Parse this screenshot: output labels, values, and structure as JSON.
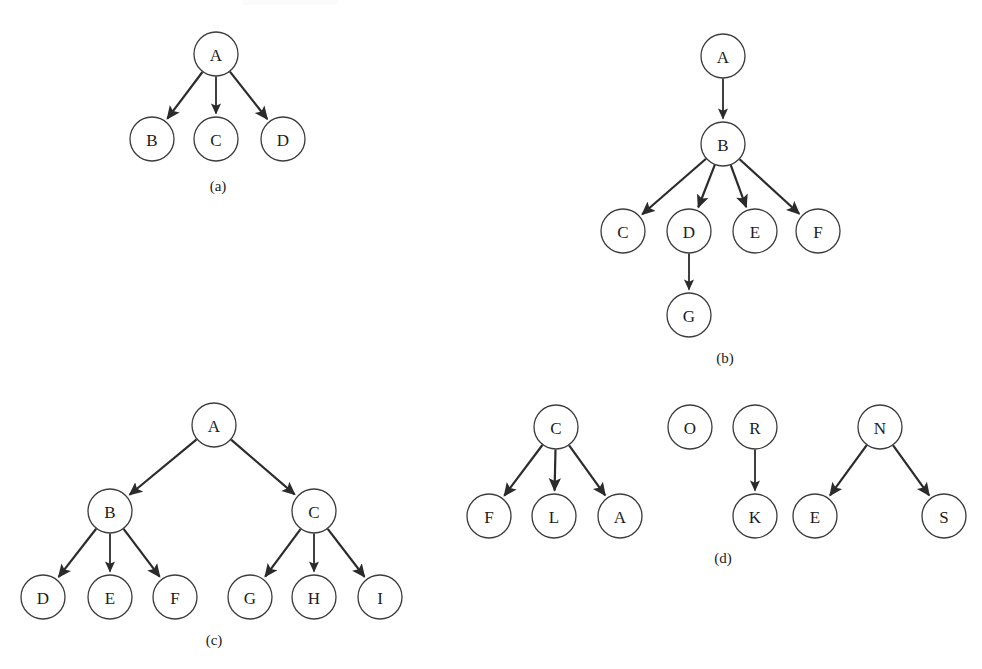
{
  "figure": {
    "width": 982,
    "height": 669,
    "background_color": "#ffffff",
    "node_stroke_color": "#3c3c3c",
    "edge_color": "#2b2b2b",
    "label_color": "#1c1c1c",
    "node_radius": 22,
    "caption_font_size": 15,
    "node_font_size": 17
  },
  "panels": [
    {
      "id": "a",
      "caption": "(a)",
      "caption_x": 218,
      "caption_y": 186,
      "nodes": [
        {
          "label": "A",
          "x": 216,
          "y": 54
        },
        {
          "label": "B",
          "x": 152,
          "y": 139
        },
        {
          "label": "C",
          "x": 216,
          "y": 139
        },
        {
          "label": "D",
          "x": 283,
          "y": 139
        }
      ],
      "edges": [
        {
          "from": "A",
          "to": "B"
        },
        {
          "from": "A",
          "to": "C"
        },
        {
          "from": "A",
          "to": "D"
        }
      ]
    },
    {
      "id": "b",
      "caption": "(b)",
      "caption_x": 725,
      "caption_y": 358,
      "nodes": [
        {
          "label": "A",
          "x": 723,
          "y": 56
        },
        {
          "label": "B",
          "x": 723,
          "y": 144
        },
        {
          "label": "C",
          "x": 623,
          "y": 231
        },
        {
          "label": "D",
          "x": 689,
          "y": 231
        },
        {
          "label": "E",
          "x": 755,
          "y": 231
        },
        {
          "label": "F",
          "x": 818,
          "y": 231
        },
        {
          "label": "G",
          "x": 689,
          "y": 315
        }
      ],
      "edges": [
        {
          "from": "A",
          "to": "B"
        },
        {
          "from": "B",
          "to": "C"
        },
        {
          "from": "B",
          "to": "D"
        },
        {
          "from": "B",
          "to": "E"
        },
        {
          "from": "B",
          "to": "F"
        },
        {
          "from": "D",
          "to": "G"
        }
      ]
    },
    {
      "id": "c",
      "caption": "(c)",
      "caption_x": 214,
      "caption_y": 640,
      "nodes": [
        {
          "label": "A",
          "x": 214,
          "y": 425
        },
        {
          "label": "B",
          "x": 110,
          "y": 511
        },
        {
          "label": "C",
          "x": 314,
          "y": 511
        },
        {
          "label": "D",
          "x": 43,
          "y": 597
        },
        {
          "label": "E",
          "x": 110,
          "y": 597
        },
        {
          "label": "F",
          "x": 175,
          "y": 597
        },
        {
          "label": "G",
          "x": 250,
          "y": 597
        },
        {
          "label": "H",
          "x": 314,
          "y": 597
        },
        {
          "label": "I",
          "x": 380,
          "y": 597
        }
      ],
      "edges": [
        {
          "from": "A",
          "to": "B"
        },
        {
          "from": "A",
          "to": "C"
        },
        {
          "from": "B",
          "to": "D"
        },
        {
          "from": "B",
          "to": "E"
        },
        {
          "from": "B",
          "to": "F"
        },
        {
          "from": "C",
          "to": "G"
        },
        {
          "from": "C",
          "to": "H"
        },
        {
          "from": "C",
          "to": "I"
        }
      ]
    },
    {
      "id": "d",
      "caption": "(d)",
      "caption_x": 723,
      "caption_y": 558,
      "nodes": [
        {
          "label": "C",
          "x": 556,
          "y": 427,
          "key": "C1"
        },
        {
          "label": "F",
          "x": 489,
          "y": 516,
          "key": "F1"
        },
        {
          "label": "L",
          "x": 554,
          "y": 516,
          "key": "L1"
        },
        {
          "label": "A",
          "x": 620,
          "y": 516,
          "key": "A1"
        },
        {
          "label": "O",
          "x": 690,
          "y": 427,
          "key": "O1"
        },
        {
          "label": "R",
          "x": 755,
          "y": 427,
          "key": "R1"
        },
        {
          "label": "K",
          "x": 755,
          "y": 516,
          "key": "K1"
        },
        {
          "label": "N",
          "x": 880,
          "y": 427,
          "key": "N1"
        },
        {
          "label": "E",
          "x": 815,
          "y": 516,
          "key": "E1"
        },
        {
          "label": "S",
          "x": 944,
          "y": 516,
          "key": "S1"
        }
      ],
      "edges": [
        {
          "from": "C1",
          "to": "F1"
        },
        {
          "from": "C1",
          "to": "L1"
        },
        {
          "from": "C1",
          "to": "A1"
        },
        {
          "from": "R1",
          "to": "K1"
        },
        {
          "from": "N1",
          "to": "E1"
        },
        {
          "from": "N1",
          "to": "S1"
        }
      ]
    }
  ]
}
